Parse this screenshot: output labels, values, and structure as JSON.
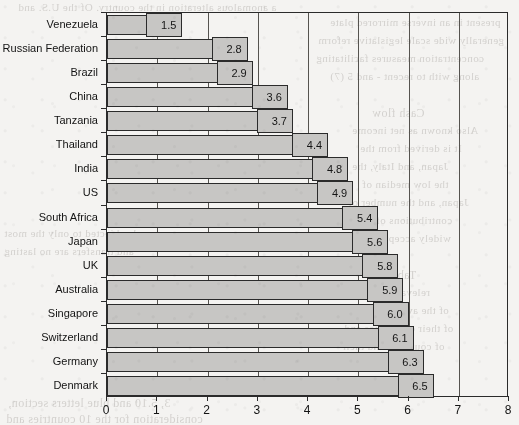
{
  "chart_data": {
    "type": "bar",
    "orientation": "horizontal",
    "title": "",
    "subtitle": "",
    "xlabel": "",
    "ylabel": "",
    "xlim": [
      0,
      8
    ],
    "xticks": [
      0,
      1,
      2,
      3,
      4,
      5,
      6,
      7,
      8
    ],
    "xtick_labels": [
      "0",
      "1",
      "2",
      "3",
      "4",
      "5",
      "6",
      "7",
      "8"
    ],
    "grid": "vertical",
    "legend": "none",
    "categories": [
      "Venezuela",
      "Russian Federation",
      "Brazil",
      "China",
      "Tanzania",
      "Thailand",
      "India",
      "US",
      "South Africa",
      "Japan",
      "UK",
      "Australia",
      "Singapore",
      "Switzerland",
      "Germany",
      "Denmark"
    ],
    "values": [
      1.5,
      2.8,
      2.9,
      3.6,
      3.7,
      4.4,
      4.8,
      4.9,
      5.4,
      5.6,
      5.8,
      5.9,
      6.0,
      6.1,
      6.3,
      6.5
    ],
    "value_labels": [
      "1.5",
      "2.8",
      "2.9",
      "3.6",
      "3.7",
      "4.4",
      "4.8",
      "4.9",
      "5.4",
      "5.6",
      "5.8",
      "5.9",
      "6.0",
      "6.1",
      "6.3",
      "6.5"
    ],
    "bar_color": "#c7c6c4",
    "bar_border_color": "#2b2b2b",
    "axis_color": "#2b2b2b",
    "text_color": "#131313",
    "background_color": "#f4f3f1"
  },
  "scan_bleed": {
    "lines": [
      "a anomalous alteration in the country. Of the U.S. and",
      "present in an inverse mirrored plate",
      "generally wide scale legislative reform",
      "concentration measures facilitating",
      "along with to recent - and 5 (7)",
      "Cash flow",
      "Also known as net income",
      "It is derived from the",
      "Japan, and Italy, the",
      "the low median of",
      "Japan, and the number of",
      "contributions of the",
      "widely accepted the",
      "Table 6",
      "relevant of a the",
      "of the average for the",
      "of their companies and",
      "of countries and their",
      "and subjected to only the most",
      "and transfers are no lasting",
      "3, 5.10 and blue letters section,",
      "consideration for the 10 countries and"
    ]
  }
}
